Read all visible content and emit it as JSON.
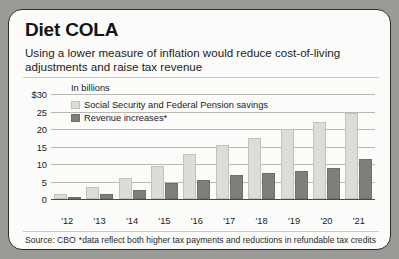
{
  "card": {
    "title": "Diet COLA",
    "subtitle": "Using a lower measure of inflation would reduce cost-of-living adjustments and raise tax revenue",
    "units_note": "In billions",
    "source": "Source: CBO",
    "footnote": "*data reflect both higher tax payments and reductions in refundable tax credits"
  },
  "colors": {
    "series_light": "#dcdcd8",
    "series_dark": "#7e7e7b",
    "card_background": "#fbfbf9",
    "page_background": "#9a9a96",
    "gridline": "#b9b9b4",
    "axis": "#4a4a4a",
    "text": "#1c1c1c"
  },
  "chart_data": {
    "type": "bar",
    "title": "Diet COLA",
    "subtitle": "Using a lower measure of inflation would reduce cost-of-living adjustments and raise tax revenue",
    "xlabel": "",
    "ylabel": "In billions",
    "ylim": [
      0,
      30
    ],
    "yticks": [
      0,
      5,
      10,
      15,
      20,
      25,
      30
    ],
    "ytick_labels": [
      "0",
      "5",
      "10",
      "15",
      "20",
      "25",
      "$30"
    ],
    "grid": true,
    "legend_position": "upper-left-inside",
    "categories": [
      "'12",
      "'13",
      "'14",
      "'15",
      "'16",
      "'17",
      "'18",
      "'19",
      "'20",
      "'21"
    ],
    "series": [
      {
        "name": "Social Security and Federal Pension savings",
        "color": "#dcdcd8",
        "values": [
          1.5,
          3.5,
          6,
          9.5,
          13,
          15.5,
          17.5,
          20,
          22,
          24.5
        ]
      },
      {
        "name": "Revenue increases*",
        "color": "#7e7e7b",
        "values": [
          0.5,
          1.5,
          2.5,
          4.5,
          5.5,
          7,
          7.5,
          8,
          9,
          11.5
        ]
      }
    ],
    "annotations": [
      "In billions",
      "*data reflect both higher tax payments and reductions in refundable tax credits"
    ],
    "source": "Source: CBO"
  }
}
